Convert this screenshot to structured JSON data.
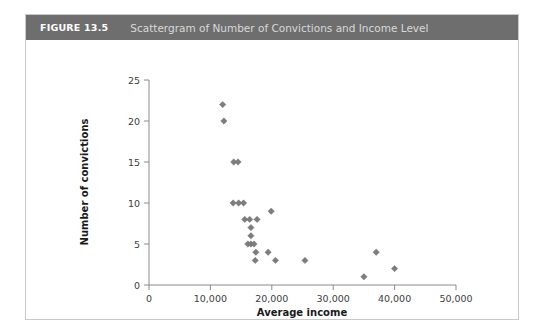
{
  "figure": {
    "number": "FIGURE 13.5",
    "title": "Scattergram of Number of Convictions and Income Level"
  },
  "colors": {
    "header_band": "#6e6e6e",
    "header_number_text": "#ffffff",
    "header_title_text": "#d9d9d9",
    "marker": "#7d7d7d",
    "axis": "#8a8a8a",
    "card_border": "#c9c9c9",
    "background": "#ffffff"
  },
  "chart_data": {
    "type": "scatter",
    "title": "Scattergram of Number of Convictions and Income Level",
    "xlabel": "Average income",
    "ylabel": "Number of convictions",
    "xlim": [
      0,
      50000
    ],
    "ylim": [
      0,
      25
    ],
    "xticks": [
      0,
      10000,
      20000,
      30000,
      40000,
      50000
    ],
    "xticklabels": [
      "0",
      "10,000",
      "20,000",
      "30,000",
      "40,000",
      "50,000"
    ],
    "yticks": [
      0,
      5,
      10,
      15,
      20,
      25
    ],
    "yticklabels": [
      "0",
      "5",
      "10",
      "15",
      "20",
      "25"
    ],
    "grid": false,
    "legend": null,
    "marker_shape": "diamond",
    "series": [
      {
        "name": "Convictions vs income",
        "points": [
          {
            "x": 12000,
            "y": 22
          },
          {
            "x": 12200,
            "y": 20
          },
          {
            "x": 13800,
            "y": 15
          },
          {
            "x": 14500,
            "y": 15
          },
          {
            "x": 13700,
            "y": 10
          },
          {
            "x": 14600,
            "y": 10
          },
          {
            "x": 15400,
            "y": 10
          },
          {
            "x": 19900,
            "y": 9
          },
          {
            "x": 15600,
            "y": 8
          },
          {
            "x": 16400,
            "y": 8
          },
          {
            "x": 17600,
            "y": 8
          },
          {
            "x": 16600,
            "y": 7
          },
          {
            "x": 16600,
            "y": 6
          },
          {
            "x": 16100,
            "y": 5
          },
          {
            "x": 16600,
            "y": 5
          },
          {
            "x": 17100,
            "y": 5
          },
          {
            "x": 17400,
            "y": 4
          },
          {
            "x": 19400,
            "y": 4
          },
          {
            "x": 37000,
            "y": 4
          },
          {
            "x": 17300,
            "y": 3
          },
          {
            "x": 20600,
            "y": 3
          },
          {
            "x": 25400,
            "y": 3
          },
          {
            "x": 40000,
            "y": 2
          },
          {
            "x": 35000,
            "y": 1
          }
        ]
      }
    ]
  }
}
